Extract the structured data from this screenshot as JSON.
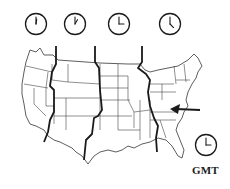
{
  "clocks": [
    {
      "zone": "Pacific",
      "time": "12:00",
      "cx": 36,
      "cy": 24,
      "hour_angle": 8,
      "minute_angle": 0
    },
    {
      "zone": "Mountain",
      "time": "1:00",
      "cx": 75,
      "cy": 24,
      "hour_angle": 30,
      "minute_angle": 0
    },
    {
      "zone": "Central",
      "time": "2:00",
      "cx": 119,
      "cy": 24,
      "hour_angle": 90,
      "minute_angle": 0
    },
    {
      "zone": "Eastern",
      "time": "4:00",
      "cx": 170,
      "cy": 24,
      "hour_angle": 135,
      "minute_angle": 0
    },
    {
      "zone": "GMT",
      "time": "9:00",
      "cx": 206,
      "cy": 145,
      "hour_angle": 90,
      "minute_angle": 0
    }
  ],
  "labels": {
    "gmt": "GMT"
  },
  "colors": {
    "ink": "#1a1a1a",
    "border": "#333333",
    "background": "#ffffff"
  }
}
